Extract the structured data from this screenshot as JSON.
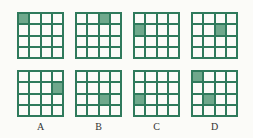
{
  "colors": {
    "line": "#2f7a5c",
    "fill": "#6fa88c"
  },
  "rows": 4,
  "cols": 4,
  "question": [
    {
      "shaded": [
        [
          0,
          0
        ]
      ]
    },
    {
      "shaded": [
        [
          0,
          2
        ]
      ]
    },
    {
      "shaded": [
        [
          1,
          0
        ]
      ]
    },
    {
      "shaded": [
        [
          1,
          2
        ]
      ]
    }
  ],
  "options": [
    {
      "label": "A",
      "shaded": [
        [
          1,
          3
        ]
      ]
    },
    {
      "label": "B",
      "shaded": [
        [
          2,
          2
        ]
      ]
    },
    {
      "label": "C",
      "shaded": [
        [
          2,
          0
        ]
      ]
    },
    {
      "label": "D",
      "shaded": [
        [
          0,
          0
        ],
        [
          2,
          1
        ]
      ]
    }
  ]
}
